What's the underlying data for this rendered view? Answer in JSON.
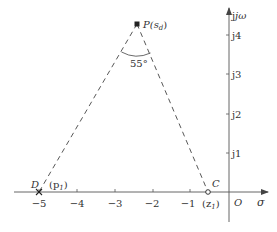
{
  "diagram": {
    "type": "s-plane root locus angle construction",
    "axes": {
      "x_label": "σ",
      "y_label": "jω",
      "origin_label": "O",
      "x_ticks": [
        "−5",
        "−4",
        "−3",
        "−2",
        "−1"
      ],
      "y_ticks": [
        "j1",
        "j2",
        "j3",
        "j4"
      ]
    },
    "points": {
      "P": {
        "label": "P(s",
        "sub": "d",
        "close": ")",
        "sigma": -2.5,
        "omega": 4.3
      },
      "D": {
        "label": "D",
        "annotation": "(p",
        "sub": "1",
        "close": ")",
        "sigma": -5,
        "omega": 0,
        "marker": "cross"
      },
      "C": {
        "label": "C",
        "annotation": "(z",
        "sub": "1",
        "close": ")",
        "sigma": -0.55,
        "omega": 0,
        "marker": "circle"
      }
    },
    "angle": {
      "value": "55°",
      "at": "P",
      "between": [
        "PD",
        "PC"
      ]
    },
    "line_style": "dashed",
    "colors": {
      "stroke": "#444444",
      "text": "#333333",
      "background": "#ffffff"
    }
  }
}
